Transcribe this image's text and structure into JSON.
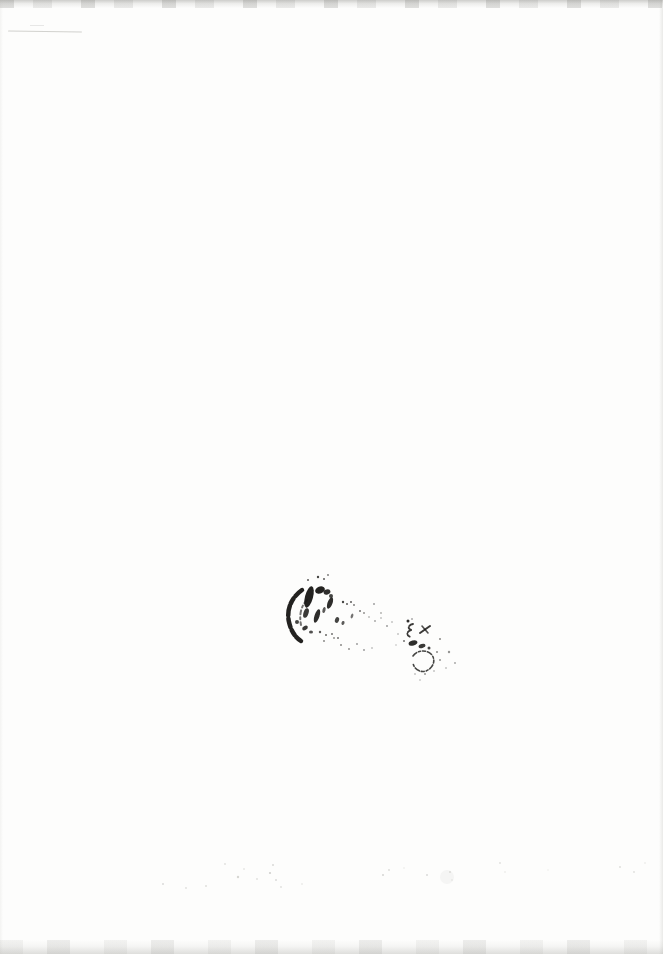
{
  "document": {
    "kind": "scanned blank page",
    "page_width": 663,
    "page_height": 954,
    "paper_color": "#fdfdfc",
    "visible_text": ""
  },
  "stamp": {
    "label": "illegible ink stamp",
    "legible": false,
    "ink_color": "#171614",
    "marks": {
      "paths": [
        {
          "d": "M 302 590 C 292 597, 286 609, 289 622 C 291 631, 295 637, 301 641",
          "w": 4.5,
          "dash": "9 3 6 2 10 3",
          "o": 0.95
        },
        {
          "d": "M 307 600 C 301 606, 299 615, 301 625",
          "w": 2,
          "dash": "4 3 2 3",
          "o": 0.6
        },
        {
          "d": "M 413 624 C 408 625, 407 629, 412 630 C 406 631, 406 636, 411 637",
          "w": 1.8,
          "dash": "4 1.5",
          "o": 0.85
        },
        {
          "d": "M 420 633 L 430 626",
          "w": 2,
          "dash": "",
          "o": 0.85
        },
        {
          "d": "M 422 626 L 428 633",
          "w": 1.6,
          "dash": "",
          "o": 0.75
        },
        {
          "d": "M 413 656 C 417 650, 427 649, 432 655 C 436 661, 433 668, 426 671 C 420 673, 414 669, 413 663",
          "w": 1.6,
          "dash": "5 2 2 2 3 2",
          "o": 0.8
        }
      ],
      "ellipses": [
        [
          309,
          597,
          4,
          11,
          15,
          0.95
        ],
        [
          306,
          613,
          2.5,
          5,
          18,
          0.85
        ],
        [
          320,
          590,
          5,
          3.5,
          -20,
          0.95
        ],
        [
          327,
          592,
          3.5,
          2.5,
          -15,
          0.9
        ],
        [
          331,
          596,
          2,
          2,
          0,
          0.8
        ],
        [
          317,
          616,
          2.5,
          7,
          18,
          0.9
        ],
        [
          330,
          603,
          2.5,
          6,
          20,
          0.9
        ],
        [
          337,
          620,
          2,
          3,
          20,
          0.8
        ],
        [
          343,
          623,
          1.5,
          2,
          20,
          0.7
        ],
        [
          305,
          628,
          3,
          2,
          -30,
          0.85
        ],
        [
          311,
          632,
          2,
          1.5,
          0,
          0.75
        ],
        [
          297,
          622,
          2,
          2,
          0,
          0.8
        ],
        [
          324,
          610,
          1.5,
          3,
          15,
          0.7
        ],
        [
          352,
          616,
          1.2,
          2.5,
          20,
          0.6
        ],
        [
          413,
          643,
          4.5,
          2.5,
          -15,
          0.9
        ],
        [
          422,
          646,
          3.5,
          2,
          -15,
          0.85
        ]
      ],
      "dots": [
        [
          318,
          577,
          1.2,
          0.8
        ],
        [
          324,
          579,
          1,
          0.7
        ],
        [
          328,
          575,
          0.9,
          0.6
        ],
        [
          308,
          580,
          1,
          0.7
        ],
        [
          343,
          602,
          1.2,
          0.8
        ],
        [
          347,
          604,
          1,
          0.7
        ],
        [
          351,
          602,
          1,
          0.7
        ],
        [
          354,
          605,
          0.9,
          0.6
        ],
        [
          360,
          611,
          1,
          0.6
        ],
        [
          364,
          613,
          0.9,
          0.5
        ],
        [
          369,
          617,
          0.8,
          0.45
        ],
        [
          375,
          621,
          0.9,
          0.4
        ],
        [
          381,
          618,
          0.8,
          0.4
        ],
        [
          387,
          626,
          0.9,
          0.45
        ],
        [
          392,
          622,
          0.8,
          0.4
        ],
        [
          320,
          632,
          1.2,
          0.7
        ],
        [
          326,
          635,
          1,
          0.65
        ],
        [
          332,
          634,
          1,
          0.6
        ],
        [
          338,
          638,
          1,
          0.6
        ],
        [
          324,
          641,
          0.9,
          0.55
        ],
        [
          334,
          638,
          0.9,
          0.5
        ],
        [
          341,
          645,
          1,
          0.5
        ],
        [
          349,
          649,
          0.9,
          0.5
        ],
        [
          357,
          644,
          0.9,
          0.45
        ],
        [
          364,
          650,
          0.9,
          0.45
        ],
        [
          372,
          648,
          0.8,
          0.4
        ],
        [
          374,
          604,
          1,
          0.4
        ],
        [
          381,
          613,
          0.9,
          0.35
        ],
        [
          408,
          621,
          1.5,
          0.9
        ],
        [
          412,
          619,
          0.8,
          0.6
        ],
        [
          429,
          648,
          1.5,
          0.8
        ],
        [
          404,
          641,
          1,
          0.6
        ],
        [
          437,
          652,
          1,
          0.5
        ],
        [
          440,
          660,
          1,
          0.45
        ],
        [
          434,
          671,
          0.8,
          0.4
        ],
        [
          415,
          674,
          0.8,
          0.4
        ],
        [
          425,
          674,
          1,
          0.45
        ],
        [
          420,
          680,
          0.8,
          0.35
        ],
        [
          398,
          634,
          0.8,
          0.4
        ],
        [
          396,
          645,
          0.7,
          0.35
        ],
        [
          440,
          639,
          1,
          0.5
        ],
        [
          449,
          652,
          1.2,
          0.45
        ],
        [
          455,
          663,
          0.9,
          0.4
        ],
        [
          446,
          668,
          0.8,
          0.4
        ]
      ]
    }
  },
  "artifacts": {
    "scan_edge_color": "#8f8f8a",
    "pencil_line_color": "#a8a8a2",
    "ghost_color": "#9a9a94",
    "ghost_specks": [
      [
        163,
        884,
        1,
        0.35
      ],
      [
        186,
        888,
        0.9,
        0.3
      ],
      [
        206,
        886,
        1,
        0.3
      ],
      [
        225,
        864,
        0.9,
        0.3
      ],
      [
        238,
        877,
        1.2,
        0.4
      ],
      [
        244,
        869,
        0.8,
        0.35
      ],
      [
        257,
        879,
        0.9,
        0.3
      ],
      [
        270,
        873,
        1.1,
        0.45
      ],
      [
        273,
        865,
        0.9,
        0.4
      ],
      [
        276,
        880,
        1,
        0.35
      ],
      [
        281,
        887,
        0.9,
        0.3
      ],
      [
        302,
        884,
        0.8,
        0.3
      ],
      [
        383,
        875,
        1,
        0.4
      ],
      [
        389,
        870,
        0.9,
        0.35
      ],
      [
        404,
        868,
        0.7,
        0.25
      ],
      [
        427,
        875,
        1,
        0.35
      ],
      [
        447,
        877,
        7,
        0.08
      ],
      [
        450,
        872,
        1,
        0.3
      ],
      [
        452,
        880,
        0.8,
        0.25
      ],
      [
        500,
        863,
        0.9,
        0.3
      ],
      [
        505,
        872,
        0.8,
        0.25
      ],
      [
        548,
        870,
        0.7,
        0.2
      ],
      [
        620,
        867,
        1,
        0.3
      ],
      [
        634,
        872,
        0.9,
        0.3
      ],
      [
        645,
        863,
        0.8,
        0.25
      ]
    ]
  }
}
